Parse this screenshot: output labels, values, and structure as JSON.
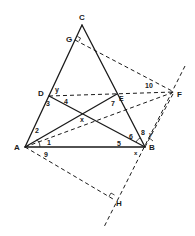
{
  "diagram": {
    "type": "geometry-figure",
    "points": {
      "C": {
        "label": "C",
        "x": 82,
        "y": 25
      },
      "G": {
        "label": "G",
        "x": 75,
        "y": 40
      },
      "D": {
        "label": "D",
        "x": 49,
        "y": 96
      },
      "E": {
        "label": "E",
        "x": 117,
        "y": 94
      },
      "F": {
        "label": "F",
        "x": 174,
        "y": 92
      },
      "A": {
        "label": "A",
        "x": 25,
        "y": 147
      },
      "B": {
        "label": "B",
        "x": 145,
        "y": 147
      },
      "X": {
        "label": "x",
        "x": 83,
        "y": 115
      },
      "H": {
        "label": "H",
        "x": 113,
        "y": 199
      }
    },
    "angle_labels": {
      "a1": "1",
      "a2": "2",
      "a3": "3",
      "a4": "4",
      "a5": "5",
      "a6": "6",
      "a7": "7",
      "a8": "8",
      "a9": "9",
      "a10": "10",
      "ay_d": "y",
      "ay_b": "y",
      "ax_b": "x",
      "ax_x": "x"
    },
    "solid_segments": [
      "AC",
      "BC",
      "AB",
      "AE",
      "BD"
    ],
    "dashed_segments": [
      "GF",
      "DF",
      "AF",
      "AH",
      "BF",
      "line-through-F-and-H"
    ],
    "right_angles": [
      "G",
      "H"
    ]
  }
}
